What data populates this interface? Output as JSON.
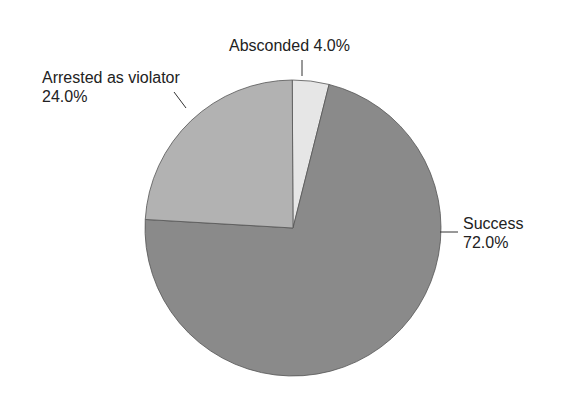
{
  "chart_data": {
    "type": "pie",
    "title": "",
    "slices": [
      {
        "label": "Success",
        "value": 72.0,
        "display": "72.0%",
        "color": "#8a8a8a"
      },
      {
        "label": "Arrested as violator",
        "value": 24.0,
        "display": "24.0%",
        "color": "#b2b2b2"
      },
      {
        "label": "Absconded",
        "value": 4.0,
        "display": "4.0%",
        "color": "#e6e6e6"
      }
    ],
    "legend": "none",
    "labels_position": "outside with leader lines"
  },
  "labels": {
    "absconded": "Absconded 4.0%",
    "arrested_line1": "Arrested as violator",
    "arrested_line2": "24.0%",
    "success_line1": "Success",
    "success_line2": "72.0%"
  }
}
